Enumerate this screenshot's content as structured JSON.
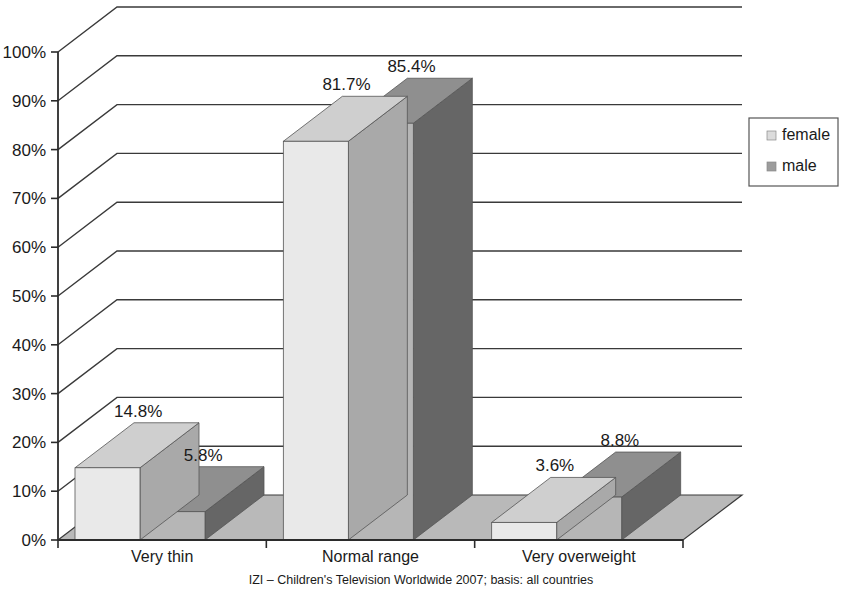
{
  "chart_data": {
    "type": "bar",
    "title": "",
    "subtitle": "",
    "xlabel": "",
    "ylabel": "",
    "categories": [
      "Very thin",
      "Normal range",
      "Very overweight"
    ],
    "series": [
      {
        "name": "female",
        "color": "#e9e9e9",
        "values": [
          14.8,
          81.7,
          3.6
        ],
        "labels": [
          "14.8%",
          "81.7%",
          "3.6%"
        ]
      },
      {
        "name": "male",
        "color": "#b6b6b6",
        "values": [
          5.8,
          85.4,
          8.8
        ],
        "labels": [
          "5.8%",
          "85.4%",
          "8.8%"
        ]
      }
    ],
    "ylim": [
      0,
      100
    ],
    "ytick_values": [
      0,
      10,
      20,
      30,
      40,
      50,
      60,
      70,
      80,
      90,
      100
    ],
    "ytick_labels": [
      "0%",
      "10%",
      "20%",
      "30%",
      "40%",
      "50%",
      "60%",
      "70%",
      "80%",
      "90%",
      "100%"
    ],
    "grid": true,
    "legend_position": "right",
    "style": "3d-columns"
  },
  "legend": {
    "items": [
      {
        "label": "female",
        "swatch_color": "#dcdcdc"
      },
      {
        "label": "male",
        "swatch_color": "#9c9c9c"
      }
    ]
  },
  "caption": {
    "text": "IZI – Children's Television Worldwide 2007; basis: all countries"
  },
  "colors": {
    "female_front": "#e9e9e9",
    "female_top": "#cfcfcf",
    "female_side": "#a9a9a9",
    "male_front": "#b6b6b6",
    "male_top": "#8f8f8f",
    "male_side": "#666666",
    "floor": "#b9b9b9",
    "axis": "#2b2b2b",
    "grid": "#3a3a3a",
    "text": "#1a1a1a"
  }
}
